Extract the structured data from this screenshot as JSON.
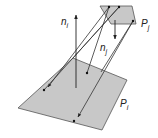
{
  "diagram": {
    "colors": {
      "patch_fill": "#c8c8c8",
      "patch_stroke": "#555555",
      "line": "#333333",
      "background": "#ffffff"
    },
    "patches": [
      {
        "id": "Pi",
        "label": "P",
        "subscript": "i"
      },
      {
        "id": "Pj",
        "label": "P",
        "subscript": "j"
      }
    ],
    "normals": [
      {
        "id": "ni",
        "label": "n",
        "subscript": "i"
      },
      {
        "id": "nj",
        "label": "n",
        "subscript": "j"
      }
    ]
  }
}
